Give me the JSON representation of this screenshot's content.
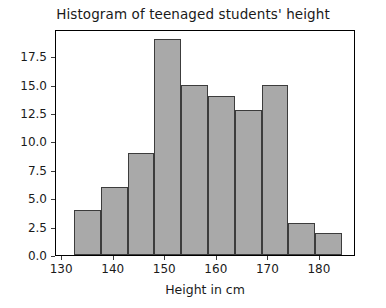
{
  "chart_data": {
    "type": "bar",
    "title": "Histogram of teenaged students' height",
    "xlabel": "Height in cm",
    "ylabel": "",
    "xlim": [
      128.8,
      187.0
    ],
    "ylim": [
      0,
      19.9
    ],
    "grid": false,
    "legend": null,
    "bar_color": "#a9a9a9",
    "edge_color": "#3c3c3c",
    "bin_edges": [
      132.3,
      137.5,
      142.7,
      147.9,
      153.1,
      158.3,
      163.5,
      168.7,
      173.9,
      179.1,
      184.3
    ],
    "categories": [
      "132.3-137.5",
      "137.5-142.7",
      "142.7-147.9",
      "147.9-153.1",
      "153.1-158.3",
      "158.3-163.5",
      "163.5-168.7",
      "168.7-173.9",
      "173.9-179.1",
      "179.1-184.3"
    ],
    "values": [
      4,
      6,
      9,
      19,
      15,
      14,
      12.8,
      15,
      2.8,
      1.9
    ],
    "xticks": [
      130,
      140,
      150,
      160,
      170,
      180
    ],
    "xtick_labels": [
      "130",
      "140",
      "150",
      "160",
      "170",
      "180"
    ],
    "yticks": [
      0.0,
      2.5,
      5.0,
      7.5,
      10.0,
      12.5,
      15.0,
      17.5
    ],
    "ytick_labels": [
      "0.0",
      "2.5",
      "5.0",
      "7.5",
      "10.0",
      "12.5",
      "15.0",
      "17.5"
    ]
  }
}
